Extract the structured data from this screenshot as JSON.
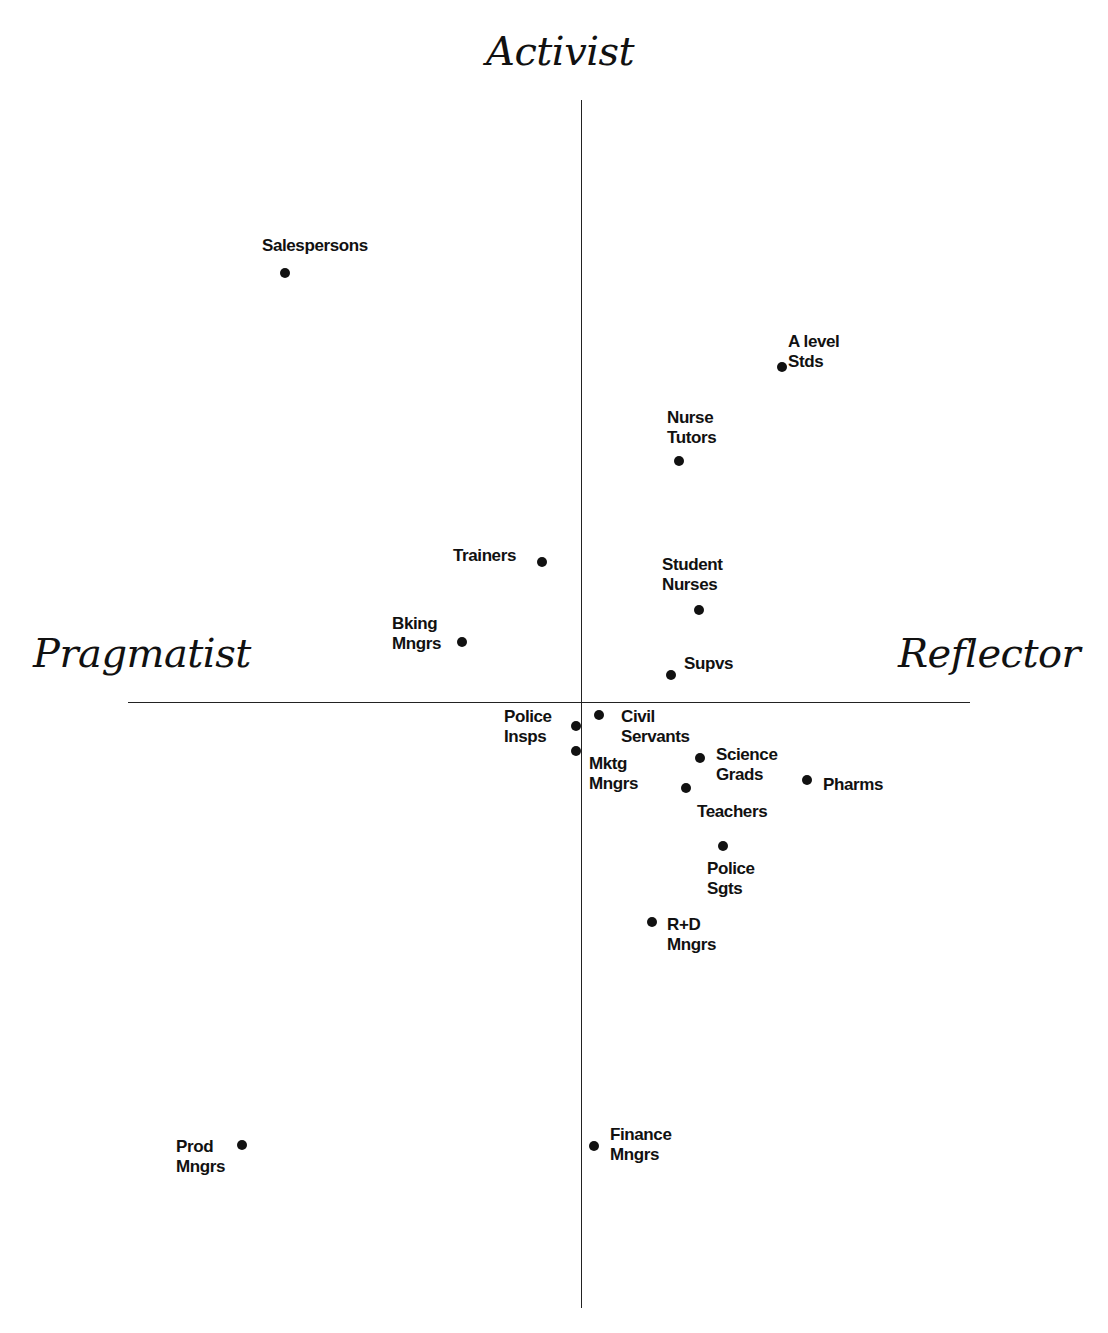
{
  "chart_data": {
    "type": "scatter",
    "title": "",
    "axes": {
      "top_label": "Activist",
      "bottom_label": "",
      "left_label": "Pragmatist",
      "right_label": "Reflector",
      "origin_px": [
        581,
        702
      ],
      "x_axis_px": [
        128,
        970
      ],
      "y_axis_px": [
        100,
        1308
      ],
      "ticks": "none"
    },
    "grid": false,
    "legend": null,
    "points": [
      {
        "name": "Salespersons",
        "lines": [
          "Salespersons"
        ],
        "px": [
          285,
          273
        ],
        "label_pos": [
          262,
          236
        ],
        "align": "left"
      },
      {
        "name": "A level Stds",
        "lines": [
          "A level",
          "Stds"
        ],
        "px": [
          782,
          367
        ],
        "label_pos": [
          788,
          332
        ],
        "align": "left"
      },
      {
        "name": "Nurse Tutors",
        "lines": [
          "Nurse",
          "Tutors"
        ],
        "px": [
          679,
          461
        ],
        "label_pos": [
          667,
          408
        ],
        "align": "left"
      },
      {
        "name": "Trainers",
        "lines": [
          "Trainers"
        ],
        "px": [
          542,
          562
        ],
        "label_pos": [
          453,
          546
        ],
        "align": "left"
      },
      {
        "name": "Student Nurses",
        "lines": [
          "Student",
          "Nurses"
        ],
        "px": [
          699,
          610
        ],
        "label_pos": [
          662,
          555
        ],
        "align": "left"
      },
      {
        "name": "Bking Mngrs",
        "lines": [
          "Bking",
          "Mngrs"
        ],
        "px": [
          462,
          642
        ],
        "label_pos": [
          392,
          614
        ],
        "align": "left"
      },
      {
        "name": "Supvs",
        "lines": [
          "Supvs"
        ],
        "px": [
          671,
          675
        ],
        "label_pos": [
          684,
          654
        ],
        "align": "left"
      },
      {
        "name": "Police Insps",
        "lines": [
          "Police",
          "Insps"
        ],
        "px": [
          576,
          726
        ],
        "label_pos": [
          504,
          707
        ],
        "align": "left"
      },
      {
        "name": "Civil Servants",
        "lines": [
          "Civil",
          "Servants"
        ],
        "px": [
          599,
          715
        ],
        "label_pos": [
          621,
          707
        ],
        "align": "left"
      },
      {
        "name": "Mktg Mngrs",
        "lines": [
          "Mktg",
          "Mngrs"
        ],
        "px": [
          576,
          751
        ],
        "label_pos": [
          589,
          754
        ],
        "align": "left"
      },
      {
        "name": "Science Grads",
        "lines": [
          "Science",
          "Grads"
        ],
        "px": [
          700,
          758
        ],
        "label_pos": [
          716,
          745
        ],
        "align": "left"
      },
      {
        "name": "Pharms",
        "lines": [
          "Pharms"
        ],
        "px": [
          807,
          780
        ],
        "label_pos": [
          823,
          775
        ],
        "align": "left"
      },
      {
        "name": "Teachers",
        "lines": [
          "Teachers"
        ],
        "px": [
          686,
          788
        ],
        "label_pos": [
          697,
          802
        ],
        "align": "left"
      },
      {
        "name": "Police Sgts",
        "lines": [
          "Police",
          "Sgts"
        ],
        "px": [
          723,
          846
        ],
        "label_pos": [
          707,
          859
        ],
        "align": "left"
      },
      {
        "name": "R+D Mngrs",
        "lines": [
          "R+D",
          "Mngrs"
        ],
        "px": [
          652,
          922
        ],
        "label_pos": [
          667,
          915
        ],
        "align": "left"
      },
      {
        "name": "Prod Mngrs",
        "lines": [
          "Prod",
          "Mngrs"
        ],
        "px": [
          242,
          1145
        ],
        "label_pos": [
          176,
          1137
        ],
        "align": "left"
      },
      {
        "name": "Finance Mngrs",
        "lines": [
          "Finance",
          "Mngrs"
        ],
        "px": [
          594,
          1146
        ],
        "label_pos": [
          610,
          1125
        ],
        "align": "left"
      }
    ]
  }
}
